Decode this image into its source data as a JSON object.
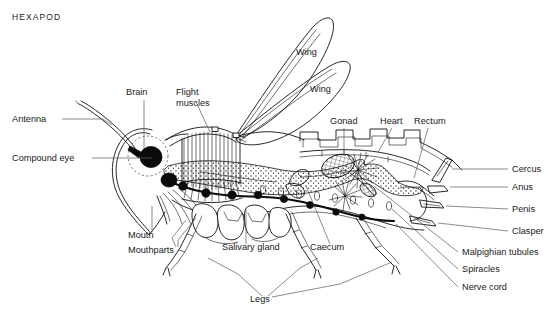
{
  "figure": {
    "title": "HEXAPOD",
    "kind": "anatomical-cutaway-diagram",
    "orientation": "head at left, abdomen at right",
    "line_color": "#111111",
    "leader_color": "#5a5a5a",
    "background": "#ffffff"
  },
  "labels": {
    "antenna": "Antenna",
    "compound_eye": "Compound eye",
    "brain": "Brain",
    "flight_muscles": "Flight\nmuscles",
    "flight_muscles_line1": "Flight",
    "flight_muscles_line2": "muscles",
    "wing_upper": "Wing",
    "wing_lower": "Wing",
    "gonad": "Gonad",
    "heart": "Heart",
    "rectum": "Rectum",
    "cercus": "Cercus",
    "anus": "Anus",
    "penis": "Penis",
    "clasper": "Clasper",
    "malpighian_tubules": "Malpighian tubules",
    "spiracles": "Spiracles",
    "nerve_cord": "Nerve cord",
    "mouth": "Mouth",
    "mouthparts": "Mouthparts",
    "salivary_gland": "Salivary gland",
    "caecum": "Caecum",
    "legs": "Legs"
  },
  "label_positions": {
    "title": {
      "x": 12,
      "y": 20
    },
    "antenna": {
      "x": 12,
      "y": 122
    },
    "compound_eye": {
      "x": 12,
      "y": 161
    },
    "brain": {
      "x": 126,
      "y": 95
    },
    "flight_muscles": {
      "x": 176,
      "y": 95
    },
    "wing_upper": {
      "x": 296,
      "y": 55
    },
    "wing_lower": {
      "x": 310,
      "y": 92
    },
    "gonad": {
      "x": 330,
      "y": 124
    },
    "heart": {
      "x": 380,
      "y": 124
    },
    "rectum": {
      "x": 414,
      "y": 124
    },
    "cercus": {
      "x": 512,
      "y": 172
    },
    "anus": {
      "x": 512,
      "y": 190
    },
    "penis": {
      "x": 512,
      "y": 212
    },
    "clasper": {
      "x": 512,
      "y": 234
    },
    "malpighian_tubules": {
      "x": 462,
      "y": 255
    },
    "spiracles": {
      "x": 462,
      "y": 272
    },
    "nerve_cord": {
      "x": 462,
      "y": 290
    },
    "mouth": {
      "x": 128,
      "y": 238
    },
    "mouthparts": {
      "x": 128,
      "y": 252
    },
    "salivary_gland": {
      "x": 222,
      "y": 250
    },
    "caecum": {
      "x": 310,
      "y": 250
    },
    "legs": {
      "x": 250,
      "y": 301
    }
  }
}
